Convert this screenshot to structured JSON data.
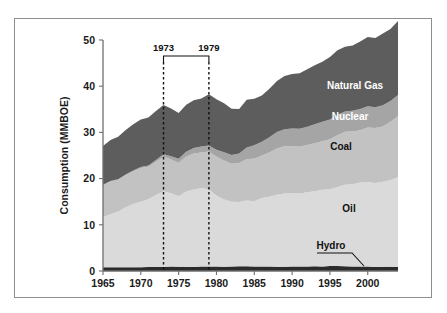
{
  "figure": {
    "background": "#ffffff",
    "frame_color": "#8d8d8d"
  },
  "chart_data": {
    "type": "area",
    "stacked": true,
    "title": "",
    "subtitle": "",
    "xlabel": "",
    "ylabel": "Consumption (MMBOE)",
    "xlim": [
      1965,
      2004
    ],
    "ylim": [
      0,
      50
    ],
    "xticks": [
      1965,
      1970,
      1975,
      1980,
      1985,
      1990,
      1995,
      2000
    ],
    "xtick_labels": [
      "1965",
      "1970",
      "1975",
      "1980",
      "1985",
      "1990",
      "1995",
      "2000"
    ],
    "yticks": [
      0,
      10,
      20,
      30,
      40,
      50
    ],
    "ytick_labels": [
      "0",
      "10",
      "20",
      "30",
      "40",
      "50"
    ],
    "grid": false,
    "legend_position": "inline-labels",
    "x": [
      1965,
      1966,
      1967,
      1968,
      1969,
      1970,
      1971,
      1972,
      1973,
      1974,
      1975,
      1976,
      1977,
      1978,
      1979,
      1980,
      1981,
      1982,
      1983,
      1984,
      1985,
      1986,
      1987,
      1988,
      1989,
      1990,
      1991,
      1992,
      1993,
      1994,
      1995,
      1996,
      1997,
      1998,
      1999,
      2000,
      2001,
      2002,
      2003,
      2004
    ],
    "series": [
      {
        "name": "Hydro",
        "color": "#2b2b2b",
        "label_color": "#111111",
        "values": [
          0.8,
          0.8,
          0.8,
          0.8,
          0.8,
          0.8,
          0.85,
          0.85,
          0.85,
          0.95,
          0.9,
          0.9,
          0.85,
          0.95,
          0.95,
          0.95,
          0.9,
          1.0,
          1.05,
          1.05,
          1.0,
          1.0,
          0.95,
          0.9,
          0.9,
          0.95,
          1.0,
          0.95,
          1.05,
          1.0,
          1.1,
          1.1,
          1.05,
          1.0,
          0.95,
          0.95,
          0.85,
          0.9,
          0.9,
          0.9
        ]
      },
      {
        "name": "Oil",
        "color": "#dadada",
        "label_color": "#111111",
        "values": [
          10.9,
          11.5,
          12.1,
          13.0,
          13.7,
          14.2,
          14.7,
          15.6,
          16.4,
          15.9,
          15.3,
          16.3,
          16.8,
          17.0,
          16.7,
          15.4,
          14.6,
          14.0,
          13.9,
          14.2,
          14.1,
          14.8,
          15.1,
          15.6,
          15.9,
          15.9,
          15.8,
          16.1,
          16.2,
          16.6,
          16.6,
          17.1,
          17.6,
          17.8,
          18.2,
          18.3,
          18.2,
          18.4,
          18.8,
          19.4
        ]
      },
      {
        "name": "Coal",
        "color": "#c2c2c2",
        "label_color": "#111111",
        "values": [
          6.9,
          7.1,
          6.9,
          7.0,
          7.1,
          7.3,
          7.0,
          7.2,
          7.5,
          7.3,
          7.2,
          7.6,
          7.8,
          7.7,
          8.2,
          8.4,
          8.4,
          8.2,
          8.4,
          9.0,
          9.2,
          9.2,
          9.6,
          10.0,
          10.2,
          10.2,
          10.1,
          10.2,
          10.4,
          10.5,
          10.8,
          11.2,
          11.5,
          11.4,
          11.3,
          11.8,
          11.9,
          12.0,
          12.6,
          13.2
        ]
      },
      {
        "name": "Nuclear",
        "color": "#a5a5a5",
        "label_color": "#ffffff",
        "values": [
          0.05,
          0.07,
          0.08,
          0.1,
          0.14,
          0.2,
          0.3,
          0.4,
          0.5,
          0.7,
          0.9,
          1.0,
          1.2,
          1.3,
          1.3,
          1.5,
          1.8,
          1.9,
          2.1,
          2.5,
          2.9,
          3.0,
          3.3,
          3.6,
          3.7,
          3.8,
          3.9,
          4.0,
          4.1,
          4.2,
          4.3,
          4.4,
          4.4,
          4.5,
          4.6,
          4.6,
          4.5,
          4.6,
          4.5,
          4.6
        ]
      },
      {
        "name": "Natural Gas",
        "color": "#5d5d5d",
        "label_color": "#ffffff",
        "values": [
          8.4,
          8.9,
          9.2,
          9.6,
          10.0,
          10.3,
          10.4,
          10.6,
          10.7,
          10.3,
          9.9,
          10.2,
          10.3,
          10.4,
          11.1,
          10.9,
          10.6,
          10.0,
          9.6,
          10.3,
          10.1,
          10.0,
          10.5,
          11.0,
          11.5,
          11.8,
          12.0,
          12.4,
          12.8,
          13.0,
          13.5,
          14.0,
          14.0,
          14.1,
          14.6,
          15.0,
          15.0,
          15.5,
          15.6,
          16.0
        ]
      }
    ],
    "totals_note": "",
    "annotations": [
      {
        "name": "event-1973",
        "label": "1973",
        "x": 1973,
        "type": "dashed-vline"
      },
      {
        "name": "event-1979",
        "label": "1979",
        "x": 1979,
        "type": "dashed-vline"
      }
    ],
    "inline_labels": [
      {
        "name": "natural-gas",
        "text": "Natural Gas",
        "color": "#ffffff"
      },
      {
        "name": "nuclear",
        "text": "Nuclear",
        "color": "#ffffff"
      },
      {
        "name": "coal",
        "text": "Coal",
        "color": "#111111"
      },
      {
        "name": "oil",
        "text": "Oil",
        "color": "#111111"
      },
      {
        "name": "hydro",
        "text": "Hydro",
        "color": "#111111"
      }
    ]
  }
}
